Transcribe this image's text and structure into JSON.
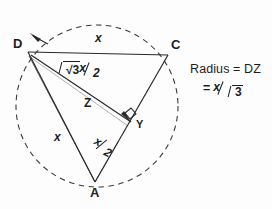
{
  "figure": {
    "type": "geometry-diagram",
    "circle": {
      "style": "dashed",
      "center": {
        "x": 97,
        "y": 106
      },
      "radius": 81
    },
    "vertices": [
      {
        "id": "D",
        "label": "D",
        "x": 28,
        "y": 52,
        "label_x": 13,
        "label_y": 44
      },
      {
        "id": "C",
        "label": "C",
        "x": 168,
        "y": 55,
        "label_x": 172,
        "label_y": 44
      },
      {
        "id": "A",
        "label": "A",
        "x": 95,
        "y": 182,
        "label_x": 91,
        "label_y": 188
      }
    ],
    "points": [
      {
        "id": "Y",
        "label": "Y",
        "x": 131,
        "y": 122,
        "label_x": 136,
        "label_y": 118
      },
      {
        "id": "Z",
        "label": "Z",
        "x": 93,
        "y": 96,
        "label_x": 85,
        "label_y": 99
      }
    ],
    "right_angle_marker": {
      "at": "Y",
      "size": 9
    },
    "edge_labels": [
      {
        "id": "dc",
        "text": "x",
        "x": 97,
        "y": 38,
        "style": "italic"
      },
      {
        "id": "da",
        "text": "x",
        "x": 57,
        "y": 137,
        "style": "italic"
      }
    ],
    "segment_labels": {
      "dy": {
        "numerator_prefix": "√3",
        "numerator": "x",
        "denominator": "2",
        "x": 62,
        "y": 66
      },
      "ya": {
        "numerator": "x",
        "denominator": "2",
        "x": 101,
        "y": 140
      }
    },
    "arrows": {
      "dy_double_headed": true,
      "from": "D",
      "to": "Y"
    }
  },
  "annotation": {
    "x": 190,
    "y": 63,
    "line1": "Radius = DZ",
    "line2_eq": "=",
    "line2_numerator": "x",
    "line2_denominator": "3",
    "line2_radical": true,
    "line2_full_text": "= x/√3"
  },
  "colors": {
    "ink": "#1d1d1d",
    "line": "#3a3a3a",
    "paper": "#fdfdfd"
  }
}
